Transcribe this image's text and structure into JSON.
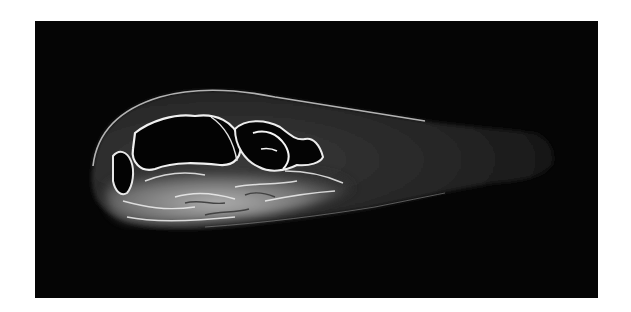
{
  "image": {
    "subject": "grayscale tomographic cross-section scan",
    "background_color": "#ffffff",
    "frame_color": "#050505",
    "highlight_color": "#f2f2f2",
    "tissue_color": "#4a4a4a"
  }
}
